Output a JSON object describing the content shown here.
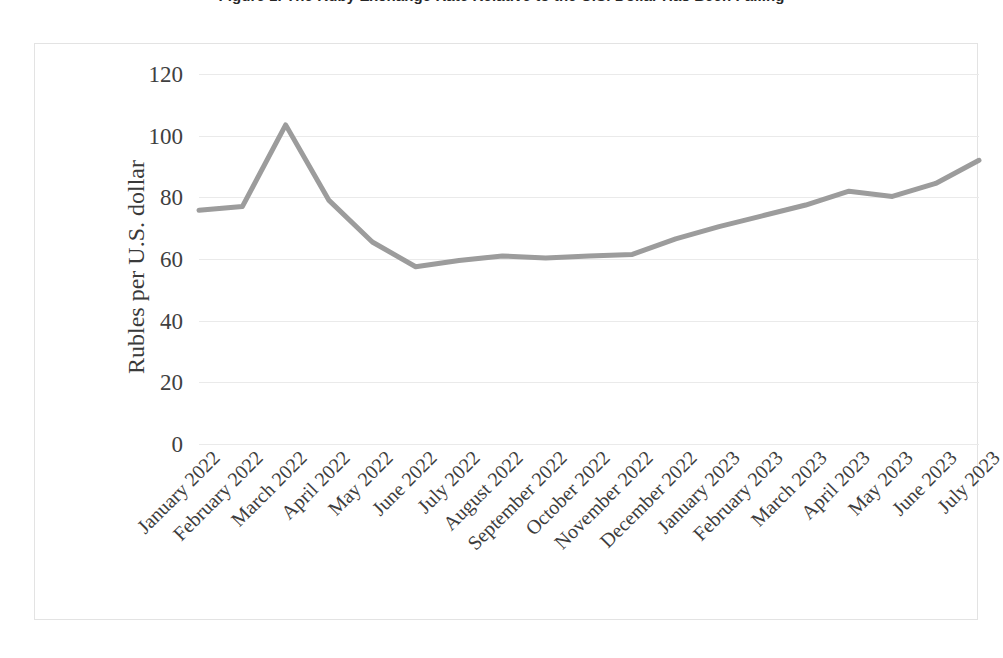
{
  "figure": {
    "title": "Figure 1. The Ruby Exchange Rate Relative to the U.S. Dollar Has Been Falling"
  },
  "chart_data": {
    "type": "line",
    "title": "",
    "xlabel": "",
    "ylabel": "Rubles per U.S. dollar",
    "ylim": [
      0,
      120
    ],
    "yticks": [
      0,
      20,
      40,
      60,
      80,
      100,
      120
    ],
    "ytick_labels": [
      "0",
      "20",
      "40",
      "60",
      "80",
      "100",
      "120"
    ],
    "grid": true,
    "legend": "none",
    "line_color": "#9c9c9c",
    "categories": [
      "January 2022",
      "February 2022",
      "March 2022",
      "April 2022",
      "May 2022",
      "June 2022",
      "July 2022",
      "August 2022",
      "September 2022",
      "October 2022",
      "November 2022",
      "December 2022",
      "January 2023",
      "February 2023",
      "March 2023",
      "April 2023",
      "May 2023",
      "June 2023",
      "July 2023"
    ],
    "values": [
      75.8,
      77.0,
      103.5,
      79.0,
      65.5,
      57.5,
      59.5,
      61.0,
      60.3,
      61.0,
      61.5,
      66.5,
      70.5,
      74.0,
      77.5,
      82.0,
      80.3,
      84.5,
      92.0
    ]
  }
}
